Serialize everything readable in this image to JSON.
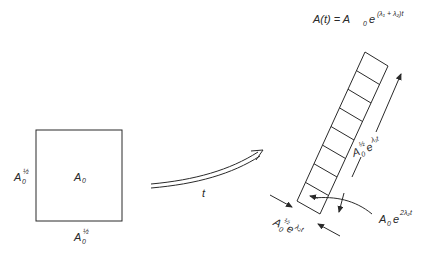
{
  "diagram": {
    "formula": {
      "lhs": "A(t) = A",
      "base_sub": "0",
      "exp_base": "e",
      "exponent": "(λ₁ + λ₂)t"
    },
    "square": {
      "center_label": "A",
      "center_sub": "0",
      "left_label": "A",
      "left_sub": "0",
      "left_sup": "½",
      "bottom_label": "A",
      "bottom_sub": "0",
      "bottom_sup": "½"
    },
    "transform_arrow": {
      "label": "t"
    },
    "strip": {
      "cell_count": 8,
      "long_side_label": {
        "base": "A",
        "sub": "0",
        "sup": "½",
        "e": "e",
        "exp": "λ₁t"
      },
      "short_side_label": {
        "base": "A",
        "sub": "0",
        "sup": "½",
        "e": "e",
        "exp": "λ₂t"
      },
      "area_label": {
        "base": "A",
        "sub": "0",
        "e": "e",
        "exp": "2λ₂t"
      }
    }
  }
}
